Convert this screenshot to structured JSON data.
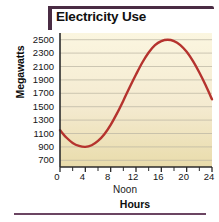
{
  "figure": {
    "title": "Electricity Use",
    "accent_color": "#4a2c44",
    "rule_color": "#6b4562"
  },
  "chart_data": {
    "type": "line",
    "title": "Electricity Use",
    "xlabel": "Hours",
    "ylabel": "Megawatts",
    "xlim": [
      0,
      24
    ],
    "ylim": [
      600,
      2600
    ],
    "grid": true,
    "legend": false,
    "line_color": "#b5332e",
    "plot_bg_top": "#fbf6e0",
    "plot_bg_bottom": "#e9dcab",
    "axis_color": "#2b2b2b",
    "gridline_color": "#b9b3a2",
    "x_ticks": [
      0,
      4,
      8,
      12,
      16,
      20,
      24
    ],
    "x_tick_labels": [
      "0",
      "4",
      "8",
      "12",
      "16",
      "20",
      "24"
    ],
    "x_minor_ticks": [
      2,
      6,
      10,
      14,
      18,
      22
    ],
    "y_ticks": [
      700,
      900,
      1100,
      1300,
      1500,
      1700,
      1900,
      2100,
      2300,
      2500
    ],
    "y_tick_labels": [
      "700",
      "900",
      "1100",
      "1300",
      "1500",
      "1700",
      "1900",
      "2100",
      "2300",
      "2500"
    ],
    "annotations": [
      {
        "text": "Noon",
        "x": 12,
        "position": "below-axis"
      }
    ],
    "series": [
      {
        "name": "Electricity Use",
        "color": "#b5332e",
        "x": [
          0,
          1,
          2,
          3,
          4,
          5,
          6,
          7,
          8,
          9,
          10,
          11,
          12,
          13,
          14,
          15,
          16,
          17,
          18,
          19,
          20,
          21,
          22,
          23,
          24
        ],
        "values": [
          1150,
          1040,
          960,
          915,
          900,
          925,
          990,
          1090,
          1230,
          1400,
          1590,
          1790,
          1980,
          2160,
          2310,
          2420,
          2480,
          2500,
          2480,
          2420,
          2320,
          2180,
          2010,
          1820,
          1610
        ]
      }
    ]
  }
}
